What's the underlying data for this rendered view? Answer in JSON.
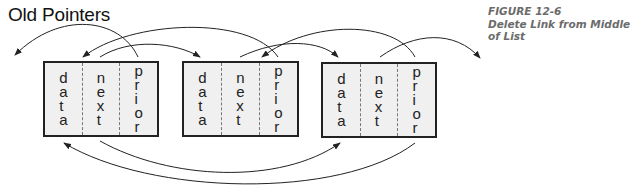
{
  "title": "Old Pointers",
  "caption": {
    "figure_label": "FIGURE 12-6",
    "line2": "Delete Link from Middle",
    "line3": "of List"
  },
  "nodes": [
    {
      "fields": [
        "data",
        "next",
        "prior"
      ]
    },
    {
      "fields": [
        "data",
        "next",
        "prior"
      ]
    },
    {
      "fields": [
        "data",
        "next",
        "prior"
      ]
    }
  ],
  "colors": {
    "node_fill": "#f0f0f0",
    "node_border": "#222222",
    "arrow": "#222222",
    "caption": "#6b6b6b"
  }
}
